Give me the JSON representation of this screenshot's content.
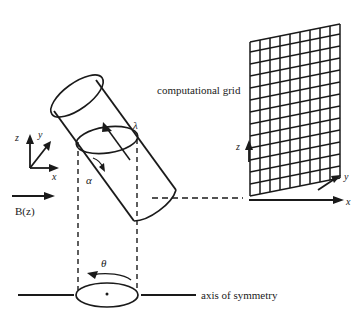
{
  "figure": {
    "colors": {
      "ink": "#1a1a1a",
      "background": "#ffffff"
    },
    "labels": {
      "computational_grid": "computational  grid",
      "axis_of_symmetry": "axis of symmetry",
      "magnetic_field": "B(z)",
      "lambda": "λ",
      "alpha": "α",
      "theta": "θ",
      "triad_x": "x",
      "triad_y": "y",
      "triad_z": "z",
      "grid_x": "x",
      "grid_y": "y",
      "grid_z": "z"
    },
    "grid": {
      "columns": 9,
      "rows": 13
    }
  }
}
